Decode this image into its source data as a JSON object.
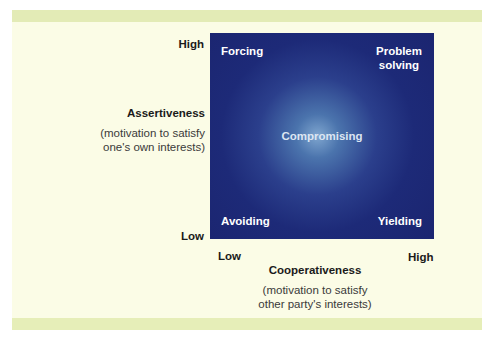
{
  "diagram": {
    "type": "2x2 conflict-handling styles matrix",
    "colors": {
      "panel_background": "#fbfce6",
      "accent_band": "#e3ebb6",
      "matrix_background": "#1b2570",
      "matrix_glow": "#7fa6cf",
      "quadrant_text": "#ffffff"
    },
    "y_axis": {
      "high_label": "High",
      "low_label": "Low",
      "title": "Assertiveness",
      "subtitle_line1": "(motivation to satisfy",
      "subtitle_line2": "one's own interests)"
    },
    "x_axis": {
      "low_label": "Low",
      "high_label": "High",
      "title": "Cooperativeness",
      "subtitle_line1": "(motivation to satisfy",
      "subtitle_line2": "other party's interests)"
    },
    "quadrants": {
      "top_left": "Forcing",
      "top_right_line1": "Problem",
      "top_right_line2": "solving",
      "center": "Compromising",
      "bottom_left": "Avoiding",
      "bottom_right": "Yielding"
    }
  }
}
